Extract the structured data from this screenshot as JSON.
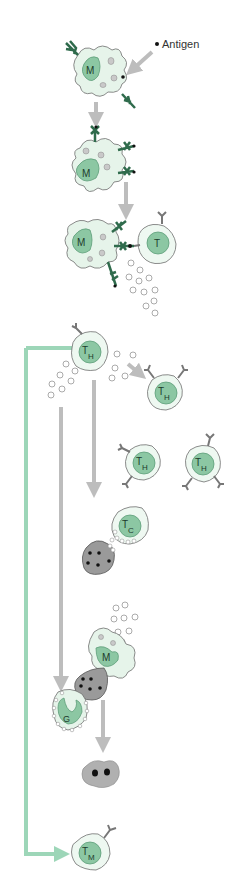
{
  "diagram": {
    "antigen_label": "Antigen",
    "cells": {
      "macrophage_1": "M",
      "macrophage_2": "M",
      "macrophage_3": "M",
      "t_cell": "T",
      "helper_main": {
        "main": "T",
        "sub": "H"
      },
      "helper_1": {
        "main": "T",
        "sub": "H"
      },
      "helper_2": {
        "main": "T",
        "sub": "H"
      },
      "helper_3": {
        "main": "T",
        "sub": "H"
      },
      "cytotoxic": {
        "main": "T",
        "sub": "C"
      },
      "macrophage_4": "M",
      "granulocyte": "G",
      "memory": {
        "main": "T",
        "sub": "M"
      }
    },
    "colors": {
      "cell_fill": "#e6f4ea",
      "nucleus_fill": "#8cc7a3",
      "nucleus_dark": "#5d9d78",
      "receptor": "#2f6b4c",
      "arrow_gray": "#bdbdbd",
      "bracket_green": "#9dd6b8",
      "infected_cell": "#9a9a9a",
      "outline": "#6e6e6e"
    }
  }
}
